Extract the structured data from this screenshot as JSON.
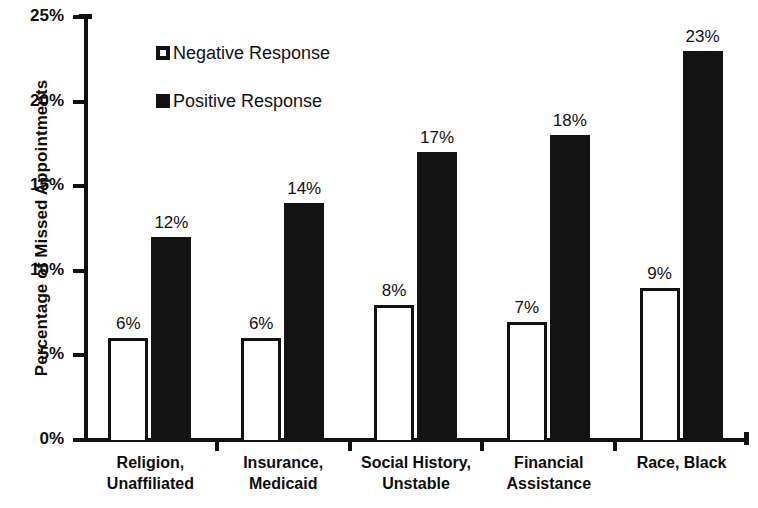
{
  "chart_data": {
    "type": "bar",
    "title": "",
    "xlabel": "",
    "ylabel": "Percentage of Missed Appointments",
    "ylim": [
      0,
      25
    ],
    "ytick_labels": [
      "0%",
      "5%",
      "10%",
      "15%",
      "20%",
      "25%"
    ],
    "ytick_values": [
      0,
      5,
      10,
      15,
      20,
      25
    ],
    "grid": false,
    "legend_position": "upper-left-inside",
    "value_suffix": "%",
    "categories": [
      {
        "line1": "Religion,",
        "line2": "Unaffiliated"
      },
      {
        "line1": "Insurance,",
        "line2": "Medicaid"
      },
      {
        "line1": "Social History,",
        "line2": "Unstable"
      },
      {
        "line1": "Financial",
        "line2": "Assistance"
      },
      {
        "line1": "Race, Black",
        "line2": ""
      }
    ],
    "series": [
      {
        "name": "Negative Response",
        "style": "hollow",
        "fill": "#ffffff",
        "stroke": "#111111",
        "values": [
          6,
          6,
          8,
          7,
          9
        ],
        "labels": [
          "6%",
          "6%",
          "8%",
          "7%",
          "9%"
        ]
      },
      {
        "name": "Positive Response",
        "style": "solid",
        "fill": "#131313",
        "stroke": "#131313",
        "values": [
          12,
          14,
          17,
          18,
          23
        ],
        "labels": [
          "12%",
          "14%",
          "17%",
          "18%",
          "23%"
        ]
      }
    ]
  }
}
